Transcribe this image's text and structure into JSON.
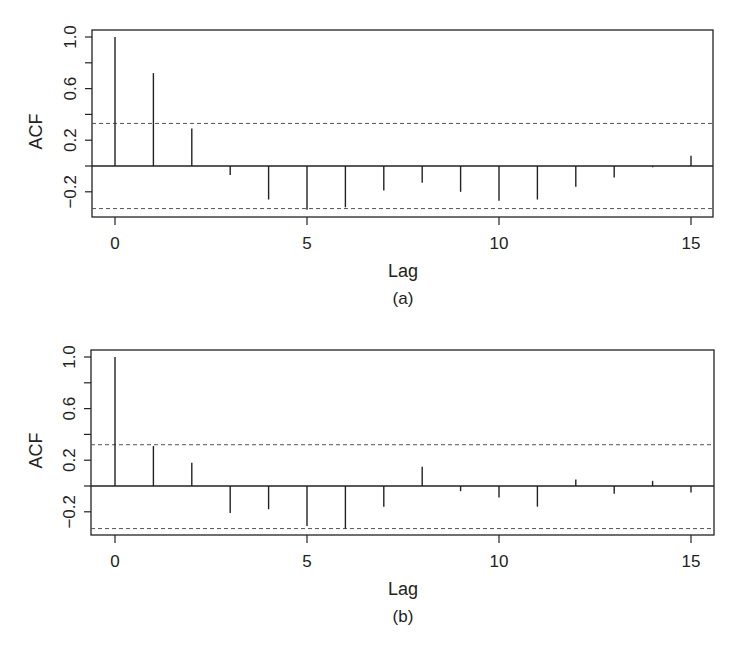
{
  "chart_data": [
    {
      "type": "bar",
      "subtype": "acf-stem",
      "panel_label": "(a)",
      "xlabel": "Lag",
      "ylabel": "ACF",
      "x": [
        0,
        1,
        2,
        3,
        4,
        5,
        6,
        7,
        8,
        9,
        10,
        11,
        12,
        13,
        14,
        15
      ],
      "values": [
        1.0,
        0.72,
        0.29,
        -0.07,
        -0.26,
        -0.34,
        -0.32,
        -0.19,
        -0.13,
        -0.2,
        -0.27,
        -0.26,
        -0.16,
        -0.09,
        -0.01,
        0.08
      ],
      "confidence_band": [
        -0.33,
        0.33
      ],
      "yticks": [
        "-0.2",
        "0.2",
        "0.6",
        "1.0"
      ],
      "ytick_values": [
        -0.2,
        0.2,
        0.6,
        1.0
      ],
      "yminor_values": [
        0.0,
        0.4,
        0.8
      ],
      "xticks": [
        "0",
        "5",
        "10",
        "15"
      ],
      "xtick_values": [
        0,
        5,
        10,
        15
      ],
      "xlim": [
        -0.6,
        15.6
      ],
      "ylim": [
        -0.39,
        1.06
      ],
      "grid": false,
      "legend": null
    },
    {
      "type": "bar",
      "subtype": "acf-stem",
      "panel_label": "(b)",
      "xlabel": "Lag",
      "ylabel": "ACF",
      "x": [
        0,
        1,
        2,
        3,
        4,
        5,
        6,
        7,
        8,
        9,
        10,
        11,
        12,
        13,
        14,
        15
      ],
      "values": [
        1.0,
        0.31,
        0.18,
        -0.21,
        -0.18,
        -0.31,
        -0.33,
        -0.16,
        0.15,
        -0.04,
        -0.09,
        -0.16,
        0.05,
        -0.06,
        0.04,
        -0.05
      ],
      "confidence_band": [
        -0.33,
        0.32
      ],
      "yticks": [
        "-0.2",
        "0.2",
        "0.6",
        "1.0"
      ],
      "ytick_values": [
        -0.2,
        0.2,
        0.6,
        1.0
      ],
      "yminor_values": [
        0.0,
        0.4,
        0.8
      ],
      "xticks": [
        "0",
        "5",
        "10",
        "15"
      ],
      "xtick_values": [
        0,
        5,
        10,
        15
      ],
      "xlim": [
        -0.6,
        15.6
      ],
      "ylim": [
        -0.38,
        1.05
      ],
      "grid": false,
      "legend": null
    }
  ],
  "panels": [
    {
      "box": {
        "x": 92,
        "y": 30,
        "w": 621,
        "h": 187
      },
      "zero_y": 166,
      "unit_px": 129,
      "lag0_x": 115,
      "lag_px": 38.4
    },
    {
      "box": {
        "x": 91,
        "y": 350,
        "w": 623,
        "h": 185
      },
      "zero_y": 486,
      "unit_px": 129,
      "lag0_x": 115,
      "lag_px": 38.4
    }
  ],
  "colors": {
    "line": "#222222",
    "dashed": "#555555",
    "background": "#ffffff"
  }
}
